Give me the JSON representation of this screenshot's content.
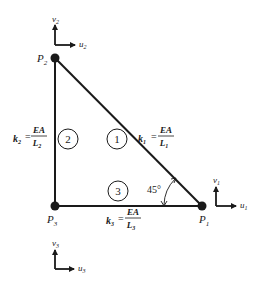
{
  "diagram": {
    "type": "truss-element-diagram",
    "nodes": [
      {
        "id": "P1",
        "label": "P",
        "sub": "1",
        "x": 202,
        "y": 206,
        "dof_u": "u",
        "dof_v": "v",
        "dof_sub": "1"
      },
      {
        "id": "P2",
        "label": "P",
        "sub": "2",
        "x": 55,
        "y": 58,
        "dof_u": "u",
        "dof_v": "v",
        "dof_sub": "2"
      },
      {
        "id": "P3",
        "label": "P",
        "sub": "3",
        "x": 55,
        "y": 206,
        "dof_u": "u",
        "dof_v": "v",
        "dof_sub": "3"
      }
    ],
    "elements": [
      {
        "id": "1",
        "from": "P2",
        "to": "P1",
        "circle_label": "1",
        "k_label": "k",
        "k_sub": "1",
        "numerator": "EA",
        "den": "L",
        "den_sub": "1"
      },
      {
        "id": "2",
        "from": "P3",
        "to": "P2",
        "circle_label": "2",
        "k_label": "k",
        "k_sub": "2",
        "numerator": "EA",
        "den": "L",
        "den_sub": "2"
      },
      {
        "id": "3",
        "from": "P3",
        "to": "P1",
        "circle_label": "3",
        "k_label": "k",
        "k_sub": "3",
        "numerator": "EA",
        "den": "L",
        "den_sub": "3"
      }
    ],
    "angle": {
      "label": "45°",
      "at": "P1"
    },
    "colors": {
      "line": "#1a1a1a",
      "node": "#1a1a1a",
      "background": "#ffffff"
    }
  }
}
